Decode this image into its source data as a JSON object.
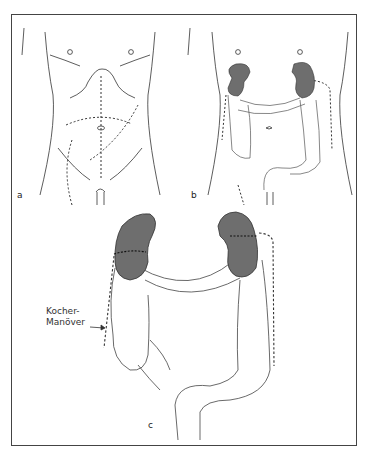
{
  "figure": {
    "panels": [
      {
        "id": "a",
        "label": "a",
        "description": "Torso outline with dashed incision lines"
      },
      {
        "id": "b",
        "label": "b",
        "description": "Torso with kidneys and colon, dashed mobilization lines"
      },
      {
        "id": "c",
        "label": "c",
        "description": "Enlarged view of kidneys and colon frame"
      }
    ],
    "annotation": {
      "line1": "Kocher-",
      "line2": "Manöver"
    },
    "colors": {
      "outline": "#333333",
      "kidney_fill": "#6e6e6e",
      "frame": "#444444",
      "background": "#ffffff"
    }
  }
}
